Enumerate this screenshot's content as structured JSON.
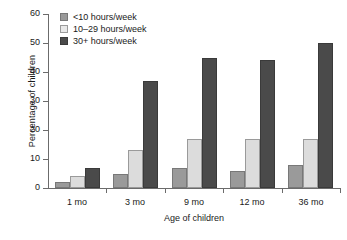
{
  "chart_data": {
    "type": "bar",
    "title": "",
    "categories": [
      "1 mo",
      "3 mo",
      "9 mo",
      "12 mo",
      "36 mo"
    ],
    "series": [
      {
        "name": "<10 hours/week",
        "color": "#9a9a9a",
        "values": [
          2,
          5,
          7,
          6,
          8
        ]
      },
      {
        "name": "10–29 hours/week",
        "color": "#dcdcdc",
        "values": [
          4,
          13,
          17,
          17,
          17
        ]
      },
      {
        "name": "30+ hours/week",
        "color": "#4a4a4a",
        "values": [
          7,
          37,
          45,
          44,
          50
        ]
      }
    ],
    "xlabel": "Age of children",
    "ylabel": "Percentage of children",
    "ylim": [
      0,
      60
    ],
    "ytick_values": [
      0,
      10,
      20,
      30,
      40,
      50,
      60
    ],
    "ytick_labels": [
      "0",
      "10",
      "20",
      "30",
      "40",
      "50",
      "60"
    ],
    "grid": false,
    "legend_position": "top-left",
    "legend_entries": [
      "<10 hours/week",
      "10–29 hours/week",
      "30+ hours/week"
    ]
  }
}
